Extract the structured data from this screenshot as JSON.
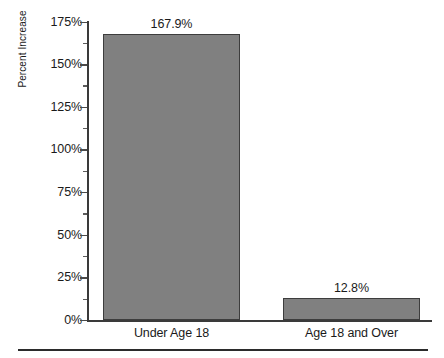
{
  "chart_data": {
    "type": "bar",
    "title": "",
    "subtitle": "",
    "xlabel": "",
    "ylabel": "Percent Increase",
    "categories": [
      "Under Age 18",
      "Age 18 and Over"
    ],
    "values": [
      167.9,
      12.8
    ],
    "value_labels": [
      "167.9%",
      "12.8%"
    ],
    "ylim": [
      0,
      175
    ],
    "ytick_values": [
      0,
      25,
      50,
      75,
      100,
      125,
      150,
      175
    ],
    "ytick_labels": [
      "0%",
      "25%",
      "50%",
      "75%",
      "100%",
      "125%",
      "150%",
      "175%"
    ],
    "yminor_tick_values": [
      12.5,
      37.5,
      62.5,
      87.5,
      112.5,
      137.5,
      162.5
    ],
    "grid": false,
    "legend": false,
    "legend_position": "none",
    "series": [
      {
        "name": "Percent Increase",
        "values": [
          167.9,
          12.8
        ]
      }
    ],
    "colors": {
      "bar_fill": "#808080",
      "bar_border": "#3d3d3d",
      "axis": "#3a3a3a",
      "text": "#1a1a1a",
      "background": "#ffffff",
      "footer_rule": "#2b2b2b"
    }
  }
}
